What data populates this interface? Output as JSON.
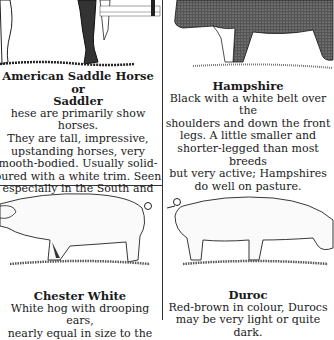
{
  "entries": [
    {
      "id": "saddle-horse",
      "title": "American Saddle Horse or Saddler",
      "title_line1": "American Saddle Horse or",
      "title_line2": "Saddler",
      "body_lines": [
        "hese are primarily show horses.",
        "They are tall, impressive,",
        "upstanding horses, very",
        "mooth-bodied. Usually solid-",
        "oured with a white trim. Seen",
        "especially in the South and",
        "Midwest."
      ]
    },
    {
      "id": "hampshire",
      "title": "Hampshire",
      "body_lines": [
        "Black with a white belt over the",
        "shoulders and down the front",
        "legs. A little smaller and",
        "shorter-legged than most breeds",
        "but very active; Hampshires",
        "do well on pasture."
      ]
    },
    {
      "id": "chester-white",
      "title": "Chester White",
      "body_lines": [
        "White hog with drooping ears,",
        "nearly equal in size to the"
      ]
    },
    {
      "id": "duroc",
      "title": "Duroc",
      "body_lines": [
        "Red-brown in colour, Durocs",
        "may be very light or quite dark."
      ]
    }
  ]
}
